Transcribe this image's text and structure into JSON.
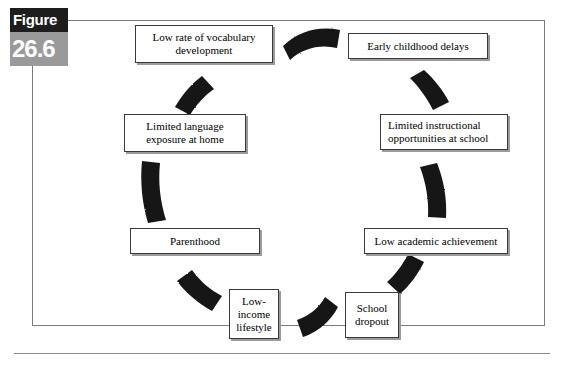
{
  "figure": {
    "label_word": "Figure",
    "label_number": "26.6"
  },
  "diagram": {
    "type": "cycle",
    "direction": "clockwise",
    "node_count": 8,
    "nodes": [
      {
        "id": "vocabulary",
        "label": "Low rate of vocabulary development"
      },
      {
        "id": "early",
        "label": "Early childhood delays"
      },
      {
        "id": "instruction",
        "label": "Limited instructional opportunities at school"
      },
      {
        "id": "academic",
        "label": "Low academic achievement"
      },
      {
        "id": "dropout",
        "label": "School dropout"
      },
      {
        "id": "lowincome",
        "label": "Low-income lifestyle"
      },
      {
        "id": "parenthood",
        "label": "Parenthood"
      },
      {
        "id": "exposure",
        "label": "Limited language exposure at home"
      }
    ],
    "connectors": [
      {
        "from": "vocabulary",
        "to": "early",
        "name": "arrow-vocabulary-to-early"
      },
      {
        "from": "early",
        "to": "instruction",
        "name": "arrow-early-to-instruction"
      },
      {
        "from": "instruction",
        "to": "academic",
        "name": "arrow-instruction-to-academic"
      },
      {
        "from": "academic",
        "to": "dropout",
        "name": "arrow-academic-to-dropout"
      },
      {
        "from": "dropout",
        "to": "lowincome",
        "name": "arrow-dropout-to-lowincome"
      },
      {
        "from": "lowincome",
        "to": "parenthood",
        "name": "arrow-lowincome-to-parenthood"
      },
      {
        "from": "parenthood",
        "to": "exposure",
        "name": "arrow-parenthood-to-exposure"
      },
      {
        "from": "exposure",
        "to": "vocabulary",
        "name": "arrow-exposure-to-vocabulary"
      }
    ]
  },
  "colors": {
    "arrow": "#151515",
    "box_border": "#3a3a3a",
    "box_shadow": "#9b9b9b",
    "frame": "#7b7b7b",
    "badge_dark": "#1d1d1d",
    "badge_gray": "#9a9a9a"
  }
}
